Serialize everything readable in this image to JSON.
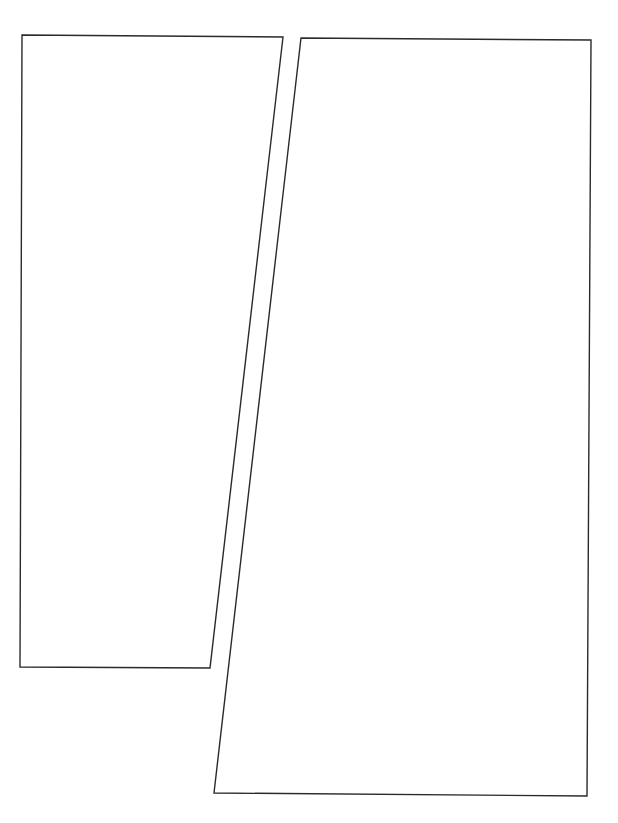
{
  "page": {
    "width": 618,
    "height": 823,
    "background": "#ffffff",
    "stroke_color": "#2a2a2a"
  },
  "panels": [
    {
      "id": "panel-1",
      "points": "22,35 283,37 210,668 20,667"
    },
    {
      "id": "panel-2",
      "points": "301,38 591,40 587,796 214,793"
    }
  ]
}
